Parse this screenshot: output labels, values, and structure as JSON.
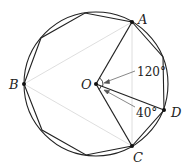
{
  "diagram": {
    "type": "geometry",
    "center": {
      "label": "O",
      "x": 96,
      "y": 84
    },
    "radius": 72,
    "polygon_sides": 9,
    "points": [
      {
        "label": "A",
        "x": 132,
        "y": 22
      },
      {
        "label": "B",
        "x": 24,
        "y": 84
      },
      {
        "label": "C",
        "x": 132,
        "y": 146
      },
      {
        "label": "D",
        "x": 164,
        "y": 110
      }
    ],
    "angles": [
      {
        "name": "angle-AOD",
        "label": "120°"
      },
      {
        "name": "angle-DOC",
        "label": "40°"
      }
    ],
    "colors": {
      "stroke": "#222222",
      "faint": "#d0d0d0"
    }
  },
  "labels": {
    "A": "A",
    "B": "B",
    "C": "C",
    "D": "D",
    "O": "O",
    "angle1": "120°",
    "angle2": "40°"
  }
}
